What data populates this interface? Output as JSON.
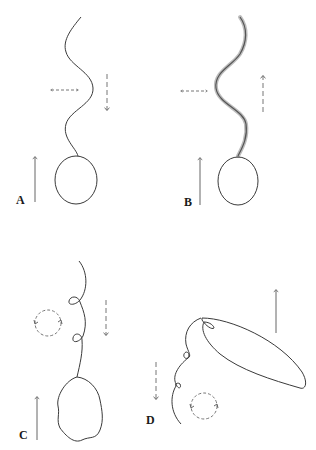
{
  "figure": {
    "panels": [
      {
        "id": "A",
        "label": "A",
        "description": "Sperm-like cell with smooth sinusoidal flagellum; cell moves up, wave propagates down, lateral beat",
        "cell_motion": "up",
        "wave_direction": "down",
        "beat": "planar-lateral"
      },
      {
        "id": "B",
        "label": "B",
        "description": "Cell with hairy (mastigoneme-bearing) sinusoidal flagellum; cell moves up, wave propagates up, lateral beat",
        "cell_motion": "up",
        "wave_direction": "up",
        "beat": "planar-lateral"
      },
      {
        "id": "C",
        "label": "C",
        "description": "Irregular cell with looped helical flagellum; cell moves up, wave propagates down, rotational beat",
        "cell_motion": "up",
        "wave_direction": "down",
        "beat": "helical-rotation"
      },
      {
        "id": "D",
        "label": "D",
        "description": "Elongated leaf-shaped cell with trailing looped helical flagellum; cell moves up, wave propagates down, rotational beat",
        "cell_motion": "up",
        "wave_direction": "down",
        "beat": "helical-rotation"
      }
    ],
    "legend_icons": {
      "solid_arrow": "arrow-up-icon",
      "dashed_arrow": "dashed-arrow-icon",
      "dashed_double_arrow": "double-arrow-icon",
      "dashed_circle": "rotation-circle-icon"
    },
    "colors": {
      "background": "#ffffff",
      "line": "#3a3a3a",
      "dashed": "#777777",
      "hairs": "#bdbdbd"
    }
  }
}
